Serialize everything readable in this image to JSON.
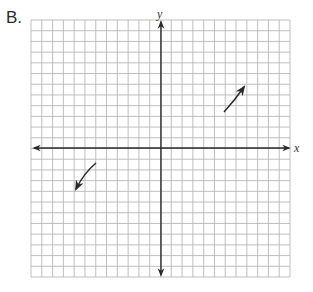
{
  "problem_label": "B.",
  "axes": {
    "x_label": "x",
    "y_label": "y"
  },
  "colors": {
    "grid": "#b8b8b8",
    "axis": "#2a2a2a",
    "curve": "#2a2a2a"
  },
  "chart_data": {
    "type": "line",
    "title": "B.",
    "xlabel": "x",
    "ylabel": "y",
    "xlim": [
      -12,
      12
    ],
    "ylim": [
      -12,
      12
    ],
    "grid": true,
    "tick_labels": [],
    "series": [
      {
        "name": "upper-right branch",
        "points": [
          [
            6,
            3.4
          ],
          [
            6.9,
            4.6
          ],
          [
            7.8,
            5.8
          ]
        ],
        "direction": "up-right arrow"
      },
      {
        "name": "lower-left branch",
        "points": [
          [
            -6,
            -1.4
          ],
          [
            -6.9,
            -2.6
          ],
          [
            -8,
            -3.9
          ]
        ],
        "direction": "down-left arrow"
      }
    ],
    "legend": []
  }
}
